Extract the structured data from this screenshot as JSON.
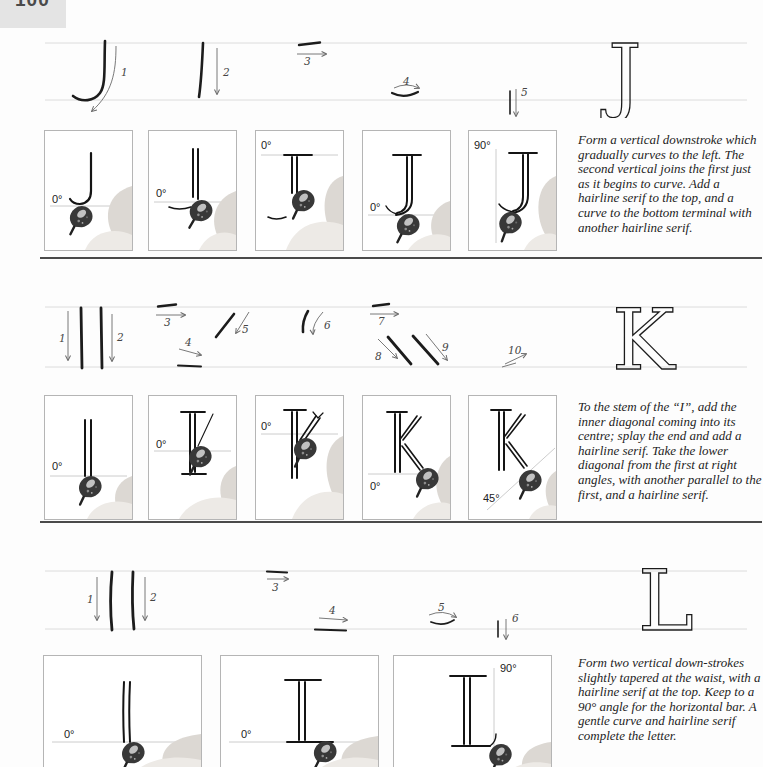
{
  "page": {
    "number": "100"
  },
  "colors": {
    "ink": "#1c1c1c",
    "rule": "#4a4a4a",
    "guideline": "#dcdcdc",
    "page_bg": "#fdfdfd"
  },
  "sections": [
    {
      "letter": "J",
      "stroke_steps": [
        "1",
        "2",
        "3",
        "4",
        "5"
      ],
      "panels": [
        {
          "angle": "0°"
        },
        {
          "angle": "0°"
        },
        {
          "angle": "0°"
        },
        {
          "angle": "0°"
        },
        {
          "angle": "90°"
        }
      ],
      "instruction": "Form a vertical downstroke which gradually curves to the left. The second vertical joins the first just as it begins to curve. Add a hairline serif to the top, and a curve to the bottom terminal with another hairline serif."
    },
    {
      "letter": "K",
      "stroke_steps": [
        "1",
        "2",
        "3",
        "4",
        "5",
        "6",
        "7",
        "8",
        "9",
        "10"
      ],
      "panels": [
        {
          "angle": "0°"
        },
        {
          "angle": "0°"
        },
        {
          "angle": "0°"
        },
        {
          "angle": "0°"
        },
        {
          "angle": "45°"
        }
      ],
      "instruction": "To the stem of the “I”, add the inner diagonal coming into its centre; splay the end and add a hairline serif. Take the lower diagonal from the first at right angles, with another parallel to the first, and a hairline serif."
    },
    {
      "letter": "L",
      "stroke_steps": [
        "1",
        "2",
        "3",
        "4",
        "5",
        "6"
      ],
      "panels": [
        {
          "angle": "0°"
        },
        {
          "angle": "0°"
        },
        {
          "angle": "90°"
        }
      ],
      "instruction": "Form two vertical down-strokes slightly tapered at the waist, with a hairline serif at the top. Keep to a 90° angle for the horizontal bar. A gentle curve and hairline serif complete the letter."
    }
  ]
}
